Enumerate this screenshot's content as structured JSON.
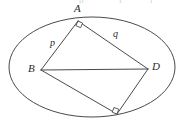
{
  "figure": {
    "stroke_color": "#4a4a4a",
    "label_color": "#2b2b2b",
    "background_color": "#ffffff",
    "ellipse": {
      "cx": 92,
      "cy": 67,
      "rx": 83,
      "ry": 50
    },
    "vertices": [
      {
        "id": "A",
        "label": "A",
        "x": 78,
        "y": 21,
        "label_x": 74,
        "label_y": 3,
        "right_angle": true
      },
      {
        "id": "B",
        "label": "B",
        "x": 41,
        "y": 70,
        "label_x": 28,
        "label_y": 63,
        "right_angle": false
      },
      {
        "id": "C",
        "label": "",
        "x": 117,
        "y": 114,
        "label_x": 0,
        "label_y": 0,
        "right_angle": true
      },
      {
        "id": "D",
        "label": "D",
        "x": 148,
        "y": 69,
        "label_x": 152,
        "label_y": 61,
        "right_angle": false
      }
    ],
    "edges": [
      {
        "id": "AB",
        "from": "A",
        "to": "B",
        "label": "p",
        "label_x": 50,
        "label_y": 38
      },
      {
        "id": "AD",
        "from": "A",
        "to": "D",
        "label": "q",
        "label_x": 113,
        "label_y": 29
      },
      {
        "id": "BC",
        "from": "B",
        "to": "C",
        "label": "",
        "label_x": 0,
        "label_y": 0
      },
      {
        "id": "CD",
        "from": "C",
        "to": "D",
        "label": "",
        "label_x": 0,
        "label_y": 0
      }
    ],
    "diagonals": [
      {
        "id": "BD",
        "from": "B",
        "to": "D",
        "label": "",
        "label_x": 0,
        "label_y": 0
      }
    ],
    "top_crumbs": [
      {
        "text": "b",
        "x": 79,
        "y": -4
      },
      {
        "text": "i",
        "x": 119,
        "y": -4
      },
      {
        "text": "i",
        "x": 150,
        "y": -4
      }
    ]
  }
}
